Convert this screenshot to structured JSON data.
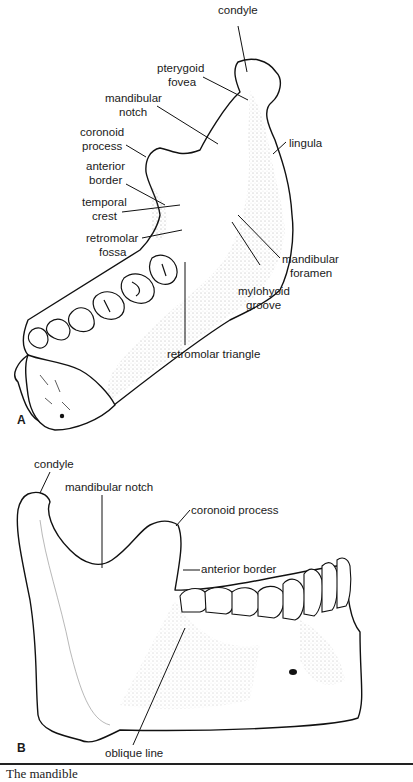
{
  "figure": {
    "panel_a": {
      "letter": "A",
      "labels": {
        "condyle": "condyle",
        "pterygoid_fovea_1": "pterygoid",
        "pterygoid_fovea_2": "fovea",
        "mandibular_notch_1": "mandibular",
        "mandibular_notch_2": "notch",
        "coronoid_process_1": "coronoid",
        "coronoid_process_2": "process",
        "anterior_border_1": "anterior",
        "anterior_border_2": "border",
        "temporal_crest_1": "temporal",
        "temporal_crest_2": "crest",
        "retromolar_fossa_1": "retromolar",
        "retromolar_fossa_2": "fossa",
        "lingula": "lingula",
        "mandibular_foramen_1": "mandibular",
        "mandibular_foramen_2": "foramen",
        "mylohyoid_groove_1": "mylohyoid",
        "mylohyoid_groove_2": "groove",
        "retromolar_triangle": "retromolar triangle"
      }
    },
    "panel_b": {
      "letter": "B",
      "labels": {
        "condyle": "condyle",
        "mandibular_notch": "mandibular notch",
        "coronoid_process": "coronoid process",
        "anterior_border": "anterior border",
        "oblique_line": "oblique line"
      }
    },
    "caption": "The mandible"
  }
}
